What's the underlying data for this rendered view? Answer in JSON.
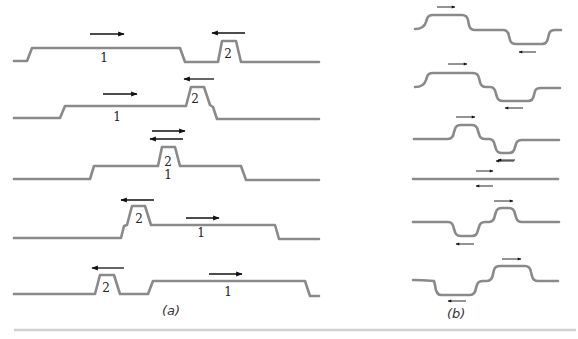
{
  "figure": {
    "panel_a": {
      "caption": "(a)",
      "rows": [
        {
          "path": "M14,61 L27,61 L32,48 L180,48 L185,62 L218,62 L222,41 L236,41 L241,62 L319,62",
          "labels": [
            {
              "text": "1",
              "x": 104,
              "y": 62
            },
            {
              "text": "2",
              "x": 228,
              "y": 58
            }
          ],
          "arrows": [
            {
              "x1": 90,
              "x2": 124,
              "y": 34,
              "dir": "right"
            },
            {
              "x1": 212,
              "x2": 245,
              "y": 33,
              "dir": "left"
            }
          ]
        },
        {
          "path": "M14,118 L60,118 L65,106 L186,106 L191,87 L204,87 L210,105 L213,107 L217,119 L319,119",
          "labels": [
            {
              "text": "1",
              "x": 117,
              "y": 121
            },
            {
              "text": "2",
              "x": 195,
              "y": 103
            }
          ],
          "arrows": [
            {
              "x1": 103,
              "x2": 137,
              "y": 94,
              "dir": "right"
            },
            {
              "x1": 184,
              "x2": 214,
              "y": 79,
              "dir": "left"
            }
          ]
        },
        {
          "path": "M14,179 L90,179 L94,166 L158,166 L162,147 L175,147 L180,166 L241,166 L246,180 L319,180",
          "labels": [
            {
              "text": "2",
              "x": 168,
              "y": 166
            },
            {
              "text": "1",
              "x": 168,
              "y": 179
            }
          ],
          "arrows": [
            {
              "x1": 152,
              "x2": 185,
              "y": 131,
              "dir": "right"
            },
            {
              "x1": 150,
              "x2": 183,
              "y": 139,
              "dir": "left"
            }
          ]
        },
        {
          "path": "M14,238 L121,238 L124,226 L127,225 L132,206 L145,206 L151,225 L275,225 L279,239 L319,239",
          "labels": [
            {
              "text": "2",
              "x": 139,
              "y": 223
            },
            {
              "text": "1",
              "x": 201,
              "y": 237
            }
          ],
          "arrows": [
            {
              "x1": 186,
              "x2": 219,
              "y": 218,
              "dir": "right"
            },
            {
              "x1": 121,
              "x2": 154,
              "y": 200,
              "dir": "left"
            }
          ]
        },
        {
          "path": "M14,294 L95,294 L100,275 L114,275 L120,294 L148,294 L153,281 L305,281 L310,296 L319,296",
          "labels": [
            {
              "text": "2",
              "x": 106,
              "y": 292
            },
            {
              "text": "1",
              "x": 228,
              "y": 296
            }
          ],
          "arrows": [
            {
              "x1": 209,
              "x2": 242,
              "y": 274,
              "dir": "right"
            },
            {
              "x1": 92,
              "x2": 124,
              "y": 268,
              "dir": "left"
            }
          ]
        }
      ]
    },
    "panel_b": {
      "caption": "(b)",
      "rows": [
        {
          "path": "M415,29 Q424,29 426,22 L427,19 Q428,15 433,15 L462,15 Q467,15 468,20 L469,25 Q470,30 475,30 L503,30 Q508,30 509,36 L510,40 Q511,44 516,44 L542,44 Q547,44 548,38 L549,34 Q550,30 555,30 L561,30",
          "arrows": [
            {
              "x1": 437,
              "x2": 455,
              "y": 7,
              "dir": "right"
            },
            {
              "x1": 519,
              "x2": 536,
              "y": 52,
              "dir": "left"
            }
          ]
        },
        {
          "path": "M415,87 Q424,87 426,80 L427,77 Q428,73 433,73 L473,73 Q478,73 479,78 L480,82 Q481,87 486,87 L490,87 Q495,87 496,94 L497,97 Q498,101 503,101 L528,101 Q533,101 534,95 L535,91 Q536,88 541,88 L560,88",
          "arrows": [
            {
              "x1": 448,
              "x2": 467,
              "y": 64,
              "dir": "right"
            },
            {
              "x1": 505,
              "x2": 523,
              "y": 108,
              "dir": "left"
            }
          ]
        },
        {
          "path": "M414,139 L448,139 Q453,139 454,132 L455,129 Q456,125 461,125 L472,125 Q477,125 478,131 L479,134 Q480,139 485,139 L489,139 Q494,139 495,146 L496,149 Q497,153 502,153 L509,153 Q514,153 515,147 L516,144 Q517,140 522,140 L559,140",
          "arrows": [
            {
              "x1": 456,
              "x2": 475,
              "y": 117,
              "dir": "right"
            },
            {
              "x1": 496,
              "x2": 514,
              "y": 161,
              "dir": "left"
            }
          ]
        },
        {
          "path": "M413,179 L558,179",
          "arrows": [
            {
              "x1": 476,
              "x2": 493,
              "y": 171,
              "dir": "right"
            },
            {
              "x1": 476,
              "x2": 493,
              "y": 186,
              "dir": "left"
            },
            {
              "x1": 498,
              "x2": 515,
              "y": 160,
              "dir": "left"
            }
          ]
        },
        {
          "path": "M413,222 L448,222 Q453,222 454,229 L455,232 Q456,236 461,236 L472,236 Q477,236 478,230 L479,227 Q480,222 485,222 L489,222 Q494,222 495,215 L496,212 Q497,208 502,208 L509,208 Q514,208 515,214 L516,217 Q517,222 522,222 L559,222",
          "arrows": [
            {
              "x1": 494,
              "x2": 513,
              "y": 201,
              "dir": "right"
            },
            {
              "x1": 456,
              "x2": 474,
              "y": 244,
              "dir": "left"
            }
          ]
        },
        {
          "path": "M413,280 Q422,280 434,281 L435,285 Q436,295 441,295 L470,295 Q475,295 476,288 L477,285 Q478,281 483,281 L487,281 Q492,281 493,274 L494,270 Q495,266 500,266 L525,266 Q530,266 531,272 L532,276 Q533,281 538,281 L558,281",
          "arrows": [
            {
              "x1": 502,
              "x2": 521,
              "y": 259,
              "dir": "right"
            },
            {
              "x1": 448,
              "x2": 466,
              "y": 301,
              "dir": "left"
            }
          ]
        }
      ]
    }
  }
}
